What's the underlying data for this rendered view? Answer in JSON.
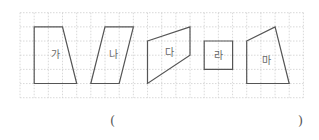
{
  "grid": {
    "origin_x": 20,
    "origin_y": 12.7,
    "cell": 14.17,
    "cols": 20,
    "rows": 6,
    "color": "#c8c8c8"
  },
  "shapes": [
    {
      "label": "가",
      "points_grid": [
        [
          1,
          1
        ],
        [
          3,
          1
        ],
        [
          4,
          5
        ],
        [
          1,
          5
        ]
      ],
      "label_pos": [
        55,
        54
      ]
    },
    {
      "label": "나",
      "points_grid": [
        [
          6,
          1
        ],
        [
          8,
          1
        ],
        [
          7,
          5
        ],
        [
          5,
          5
        ]
      ],
      "label_pos": [
        113,
        54
      ]
    },
    {
      "label": "다",
      "points_grid": [
        [
          9,
          2
        ],
        [
          12,
          1
        ],
        [
          12,
          3
        ],
        [
          9,
          5
        ]
      ],
      "label_pos": [
        169,
        52
      ]
    },
    {
      "label": "라",
      "points_grid": [
        [
          13,
          2
        ],
        [
          15,
          2
        ],
        [
          15,
          4
        ],
        [
          13,
          4
        ]
      ],
      "label_pos": [
        218,
        55
      ]
    },
    {
      "label": "마",
      "points_grid": [
        [
          16,
          2
        ],
        [
          18,
          1
        ],
        [
          19,
          5
        ],
        [
          16,
          5
        ]
      ],
      "label_pos": [
        266,
        60
      ]
    }
  ],
  "answer_blank": {
    "open": "(",
    "close": ")"
  },
  "colors": {
    "stroke": "#555555",
    "text": "#666666"
  }
}
